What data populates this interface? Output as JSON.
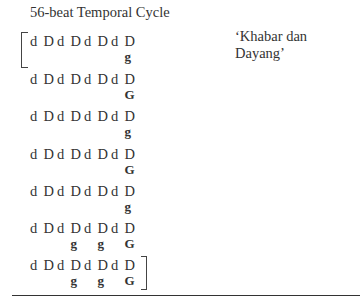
{
  "title": "56-beat Temporal Cycle",
  "caption": "‘Khabar dan Dayang’",
  "rows": [
    {
      "beats": [
        "d",
        "D",
        "d",
        "D",
        "d",
        "D",
        "d",
        "D"
      ],
      "strokes": [
        "",
        "",
        "",
        "",
        "",
        "",
        "",
        "g"
      ]
    },
    {
      "beats": [
        "d",
        "D",
        "d",
        "D",
        "d",
        "D",
        "d",
        "D"
      ],
      "strokes": [
        "",
        "",
        "",
        "",
        "",
        "",
        "",
        "G"
      ]
    },
    {
      "beats": [
        "d",
        "D",
        "d",
        "D",
        "d",
        "D",
        "d",
        "D"
      ],
      "strokes": [
        "",
        "",
        "",
        "",
        "",
        "",
        "",
        "g"
      ]
    },
    {
      "beats": [
        "d",
        "D",
        "d",
        "D",
        "d",
        "D",
        "d",
        "D"
      ],
      "strokes": [
        "",
        "",
        "",
        "",
        "",
        "",
        "",
        "G"
      ]
    },
    {
      "beats": [
        "d",
        "D",
        "d",
        "D",
        "d",
        "D",
        "d",
        "D"
      ],
      "strokes": [
        "",
        "",
        "",
        "",
        "",
        "",
        "",
        "g"
      ]
    },
    {
      "beats": [
        "d",
        "D",
        "d",
        "D",
        "d",
        "D",
        "d",
        "D"
      ],
      "strokes": [
        "",
        "",
        "",
        "g",
        "",
        "g",
        "",
        "G"
      ]
    },
    {
      "beats": [
        "d",
        "D",
        "d",
        "D",
        "d",
        "D",
        "d",
        "D"
      ],
      "strokes": [
        "",
        "",
        "",
        "g",
        "",
        "g",
        "",
        "G"
      ]
    }
  ]
}
